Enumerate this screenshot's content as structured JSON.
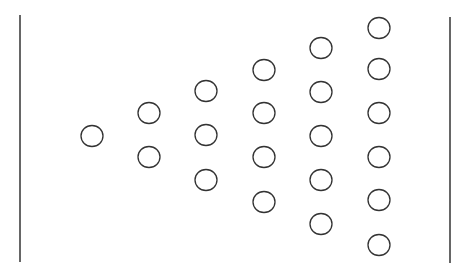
{
  "diagram": {
    "width": 466,
    "height": 275,
    "stroke_color": "#333333",
    "background": "#ffffff",
    "circle_rx": 11,
    "circle_ry": 10.5,
    "left_line": {
      "x": 20,
      "y1": 15,
      "y2": 262
    },
    "right_line": {
      "x": 450,
      "y1": 17,
      "y2": 263
    },
    "columns": [
      {
        "x": 92,
        "ys": [
          136
        ]
      },
      {
        "x": 149,
        "ys": [
          113,
          157
        ]
      },
      {
        "x": 206,
        "ys": [
          91,
          135,
          180
        ]
      },
      {
        "x": 264,
        "ys": [
          70,
          113,
          157,
          202
        ]
      },
      {
        "x": 321,
        "ys": [
          48,
          92,
          136,
          180,
          224
        ]
      },
      {
        "x": 379,
        "ys": [
          28,
          69,
          113,
          157,
          200,
          245
        ]
      }
    ]
  }
}
